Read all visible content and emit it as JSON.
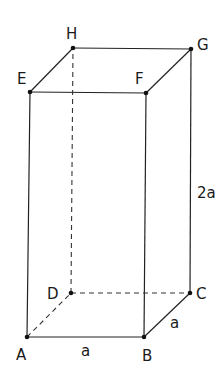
{
  "diagram": {
    "type": "rectangular-prism",
    "vertices": {
      "A": {
        "label": "A",
        "x": 27,
        "y": 337
      },
      "B": {
        "label": "B",
        "x": 144,
        "y": 337
      },
      "C": {
        "label": "C",
        "x": 190,
        "y": 293
      },
      "D": {
        "label": "D",
        "x": 71,
        "y": 293
      },
      "E": {
        "label": "E",
        "x": 30,
        "y": 92
      },
      "F": {
        "label": "F",
        "x": 146,
        "y": 93
      },
      "G": {
        "label": "G",
        "x": 191,
        "y": 49
      },
      "H": {
        "label": "H",
        "x": 73,
        "y": 48
      }
    },
    "dimensions": {
      "ab": "a",
      "bc": "a",
      "height": "2a"
    },
    "hidden_edges": [
      "AD",
      "DC",
      "DH"
    ],
    "visible_edges": [
      "AB",
      "BC",
      "EF",
      "FG",
      "GH",
      "HE",
      "AE",
      "BF",
      "CG"
    ]
  }
}
